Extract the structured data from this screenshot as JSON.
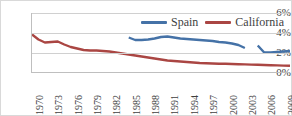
{
  "chart_data": {
    "type": "line",
    "title": "",
    "xlabel": "",
    "ylabel": "",
    "grid": true,
    "legend_position": "top-right",
    "ylim": [
      0,
      6
    ],
    "xlim": [
      1970,
      2010
    ],
    "ytick_labels": [
      "6%",
      "4%",
      "2%",
      "0%"
    ],
    "ytick_values": [
      6,
      4,
      2,
      0
    ],
    "xtick_labels": [
      "1970",
      "1973",
      "1976",
      "1979",
      "1982",
      "1985",
      "1988",
      "1991",
      "1994",
      "1997",
      "2000",
      "2003",
      "2006",
      "2009"
    ],
    "xtick_values": [
      1970,
      1973,
      1976,
      1979,
      1982,
      1985,
      1988,
      1991,
      1994,
      1997,
      2000,
      2003,
      2006,
      2009
    ],
    "series": [
      {
        "name": "Spain",
        "color": "#4572A7",
        "x": [
          1985,
          1986,
          1987,
          1988,
          1989,
          1990,
          1991,
          1992,
          1993,
          1994,
          1995,
          1996,
          1997,
          1998,
          1999,
          2000,
          2001,
          2002,
          2003,
          2005,
          2006,
          2007,
          2008,
          2009,
          2010
        ],
        "values": [
          3.55,
          3.3,
          3.3,
          3.35,
          3.45,
          3.6,
          3.65,
          3.55,
          3.45,
          3.4,
          3.35,
          3.3,
          3.25,
          3.2,
          3.1,
          3.05,
          2.95,
          2.8,
          2.5,
          2.75,
          2.05,
          2.05,
          2.1,
          2.15,
          2.2
        ],
        "gaps": [
          [
            2003,
            2005
          ]
        ]
      },
      {
        "name": "California",
        "color": "#AA4643",
        "x": [
          1970,
          1971,
          1972,
          1973,
          1974,
          1975,
          1976,
          1977,
          1978,
          1979,
          1980,
          1981,
          1982,
          1983,
          1984,
          1985,
          1986,
          1987,
          1988,
          1989,
          1990,
          1991,
          1992,
          1993,
          1994,
          1995,
          1996,
          1997,
          1998,
          1999,
          2000,
          2001,
          2002,
          2003,
          2004,
          2005,
          2006,
          2007,
          2008,
          2009,
          2010
        ],
        "values": [
          3.85,
          3.35,
          3.05,
          3.1,
          3.15,
          2.85,
          2.6,
          2.45,
          2.3,
          2.25,
          2.25,
          2.2,
          2.15,
          2.05,
          1.95,
          1.85,
          1.75,
          1.65,
          1.55,
          1.45,
          1.35,
          1.25,
          1.2,
          1.15,
          1.1,
          1.05,
          1.0,
          0.98,
          0.95,
          0.93,
          0.92,
          0.9,
          0.88,
          0.86,
          0.84,
          0.82,
          0.8,
          0.78,
          0.76,
          0.74,
          0.72
        ],
        "gaps": []
      }
    ]
  },
  "legend": {
    "entries": [
      {
        "label": "Spain",
        "color": "#4572A7"
      },
      {
        "label": "California",
        "color": "#AA4643"
      }
    ]
  },
  "axes": {
    "y_labels": [
      "6%",
      "4%",
      "2%",
      "0%"
    ],
    "x_labels": [
      "1970",
      "1973",
      "1976",
      "1979",
      "1982",
      "1985",
      "1988",
      "1991",
      "1994",
      "1997",
      "2000",
      "2003",
      "2006",
      "2009"
    ]
  }
}
